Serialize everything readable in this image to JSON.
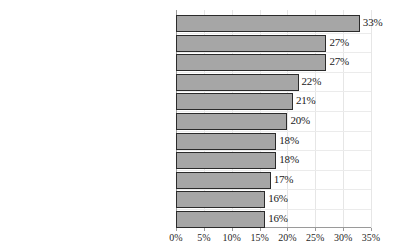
{
  "chart_data": {
    "type": "bar",
    "orientation": "horizontal",
    "title": "",
    "subtitle": "",
    "xlabel": "",
    "ylabel": "",
    "xlim": [
      0,
      35
    ],
    "xtick_values": [
      0,
      5,
      10,
      15,
      20,
      25,
      30,
      35
    ],
    "xtick_labels": [
      "0%",
      "5%",
      "10%",
      "15%",
      "20%",
      "25%",
      "30%",
      "35%"
    ],
    "grid": true,
    "legend": null,
    "value_suffix": "%",
    "categories": [
      "New friends",
      "Move and want to make new friends",
      "Lonely and want to make new friends",
      "Child wants to go",
      "Friend invites me",
      "A good community",
      "Spouse wants to go",
      "Feel the distance from God",
      "Begin to miss church",
      "Supernatural phenomena",
      "Don't have better options on Sunday morning"
    ],
    "values": [
      33,
      27,
      27,
      22,
      21,
      20,
      18,
      18,
      17,
      16,
      16
    ],
    "data_labels": [
      "33%",
      "27%",
      "27%",
      "22%",
      "21%",
      "20%",
      "18%",
      "18%",
      "17%",
      "16%",
      "16%"
    ],
    "colors": {
      "bar_fill": "#a6a6a6",
      "bar_border": "#2b2b2b",
      "grid": "#e6e6e6",
      "axis": "#9a9a9a",
      "text": "#1f1f1f",
      "background": "#ffffff"
    }
  }
}
